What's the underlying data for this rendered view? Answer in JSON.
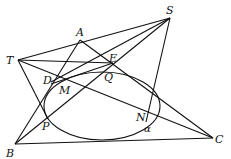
{
  "diagram": {
    "curve_label": "α",
    "stroke_color": "#111111",
    "background": "#ffffff",
    "points": {
      "S": {
        "label": "S",
        "x": 170,
        "y": 18
      },
      "T": {
        "label": "T",
        "x": 18,
        "y": 60
      },
      "A": {
        "label": "A",
        "x": 80,
        "y": 40
      },
      "E": {
        "label": "E",
        "x": 113,
        "y": 63
      },
      "D": {
        "label": "D",
        "x": 51,
        "y": 82
      },
      "M": {
        "label": "M",
        "x": 61,
        "y": 83
      },
      "Q": {
        "label": "Q",
        "x": 111,
        "y": 70
      },
      "P": {
        "label": "P",
        "x": 48,
        "y": 119
      },
      "N": {
        "label": "N",
        "x": 150,
        "y": 113
      },
      "B": {
        "label": "B",
        "x": 15,
        "y": 144
      },
      "C": {
        "label": "C",
        "x": 213,
        "y": 138
      }
    },
    "ellipse": {
      "cx": 102,
      "cy": 106,
      "rx": 58,
      "ry": 34,
      "label": "α"
    },
    "segments": [
      [
        "T",
        "S"
      ],
      [
        "T",
        "B"
      ],
      [
        "B",
        "C"
      ],
      [
        "S",
        "N"
      ],
      [
        "A",
        "B"
      ],
      [
        "A",
        "C"
      ],
      [
        "B",
        "S"
      ],
      [
        "T",
        "C"
      ],
      [
        "T",
        "E"
      ],
      [
        "S",
        "D"
      ],
      [
        "M",
        "E"
      ]
    ]
  }
}
